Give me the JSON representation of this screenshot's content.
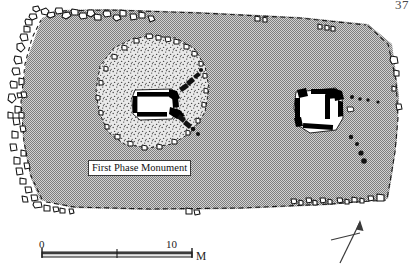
{
  "page": {
    "number": "37"
  },
  "figure": {
    "type": "archaeological-site-plan",
    "monument_label": "First Phase Monument",
    "scale": {
      "start": "0",
      "end": "10",
      "unit": "M",
      "ticks": [
        "0",
        "10"
      ],
      "midpoint_tick": true
    },
    "north_arrow": {
      "name": "north-arrow",
      "rotation_deg": 18
    },
    "colors": {
      "mound_fill": "#a8a8a8",
      "cairn_stipple": "#cfcfcf",
      "stone_outline": "#111111",
      "wall_fill": "#000000",
      "chamber_fill": "#ffffff",
      "ink": "#1a1a1a"
    },
    "features": [
      {
        "name": "mound-outline",
        "style": "dashed",
        "label": ""
      },
      {
        "name": "kerb-stones",
        "style": "outlined-stones",
        "label": ""
      },
      {
        "name": "first-phase-cairn",
        "style": "stippled",
        "label": "First Phase Monument"
      },
      {
        "name": "central-chamber",
        "style": "orthostat-walls",
        "label": ""
      },
      {
        "name": "passage-alignment",
        "style": "stone-line",
        "label": ""
      },
      {
        "name": "eastern-structure",
        "style": "orthostat-walls",
        "label": ""
      }
    ]
  }
}
